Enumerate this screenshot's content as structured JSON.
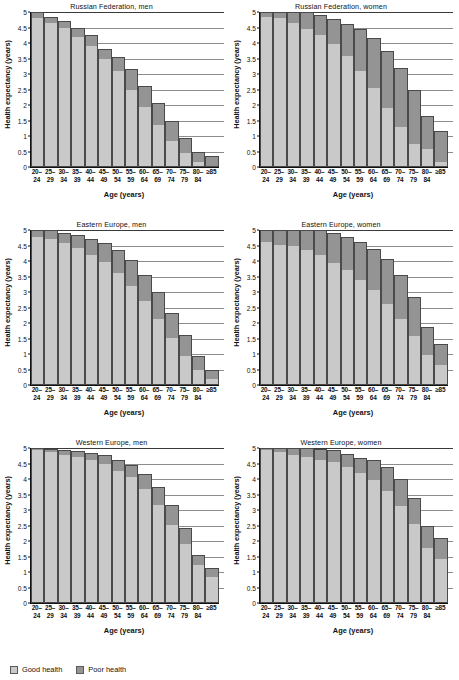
{
  "figure": {
    "axis_x_label": "Age (years)",
    "axis_y_label": "Health expectancy (years)",
    "y_ticks": [
      "5",
      "4.5",
      "4",
      "3.5",
      "3",
      "2.5",
      "2",
      "1.5",
      "1",
      "0.5",
      "0"
    ],
    "x_categories_line1": [
      "20–",
      "25–",
      "30–",
      "35–",
      "40–",
      "45–",
      "50–",
      "55–",
      "60–",
      "65–",
      "70–",
      "75–",
      "80–",
      "≥85"
    ],
    "x_categories_line2": [
      "24",
      "29",
      "34",
      "39",
      "44",
      "49",
      "54",
      "59",
      "64",
      "69",
      "74",
      "79",
      "84",
      ""
    ],
    "colors": {
      "good_health": "#c9c9c9",
      "poor_health": "#949494",
      "outline": "#4a4a4a",
      "gridline": "#8c8c8c"
    }
  },
  "legend": {
    "items": [
      {
        "label": "Good health",
        "color": "#c9c9c9"
      },
      {
        "label": "Poor health",
        "color": "#949494"
      }
    ]
  },
  "chart_data": [
    {
      "type": "bar",
      "title": "Russian Federation, men",
      "xlabel": "Age (years)",
      "ylabel": "Health expectancy (years)",
      "ylim": [
        0,
        5
      ],
      "grid": true,
      "stacked": true,
      "categories": [
        "20–24",
        "25–29",
        "30–34",
        "35–39",
        "40–44",
        "45–49",
        "50–54",
        "55–59",
        "60–64",
        "65–69",
        "70–74",
        "75–79",
        "80–84",
        "≥85"
      ],
      "series": [
        {
          "name": "Good health",
          "values": [
            4.8,
            4.65,
            4.5,
            4.2,
            3.9,
            3.5,
            3.1,
            2.5,
            1.95,
            1.35,
            0.85,
            0.45,
            0.15,
            0.0
          ]
        },
        {
          "name": "Poor health",
          "values": [
            0.2,
            0.2,
            0.2,
            0.3,
            0.35,
            0.3,
            0.45,
            0.65,
            0.65,
            0.7,
            0.62,
            0.5,
            0.35,
            0.32
          ]
        }
      ],
      "totals": [
        5.0,
        4.85,
        4.7,
        4.5,
        4.25,
        3.8,
        3.55,
        3.15,
        2.6,
        2.05,
        1.47,
        0.95,
        0.5,
        0.32
      ]
    },
    {
      "type": "bar",
      "title": "Russian Federation, women",
      "xlabel": "Age (years)",
      "ylabel": "Health expectancy (years)",
      "ylim": [
        0,
        5
      ],
      "grid": true,
      "stacked": true,
      "categories": [
        "20–24",
        "25–29",
        "30–34",
        "35–39",
        "40–44",
        "45–49",
        "50–54",
        "55–59",
        "60–64",
        "65–69",
        "70–74",
        "75–79",
        "80–84",
        "≥85"
      ],
      "series": [
        {
          "name": "Good health",
          "values": [
            4.85,
            4.8,
            4.65,
            4.45,
            4.27,
            3.97,
            3.58,
            3.1,
            2.55,
            1.9,
            1.28,
            0.75,
            0.58,
            0.17
          ]
        },
        {
          "name": "Poor health",
          "values": [
            0.15,
            0.2,
            0.35,
            0.55,
            0.63,
            0.82,
            1.02,
            1.35,
            1.6,
            1.85,
            1.92,
            1.73,
            1.05,
            0.98
          ]
        }
      ],
      "totals": [
        5.0,
        5.0,
        5.0,
        5.0,
        4.9,
        4.79,
        4.6,
        4.45,
        4.15,
        3.75,
        3.2,
        2.48,
        1.63,
        1.15
      ]
    },
    {
      "type": "bar",
      "title": "Eastern Europe, men",
      "xlabel": "Age (years)",
      "ylabel": "Health expectancy (years)",
      "ylim": [
        0,
        5
      ],
      "grid": true,
      "stacked": true,
      "categories": [
        "20–24",
        "25–29",
        "30–34",
        "35–39",
        "40–44",
        "45–49",
        "50–54",
        "55–59",
        "60–64",
        "65–69",
        "70–74",
        "75–79",
        "80–84",
        "≥85"
      ],
      "series": [
        {
          "name": "Good health",
          "values": [
            4.78,
            4.7,
            4.57,
            4.43,
            4.2,
            3.98,
            3.62,
            3.2,
            2.7,
            2.12,
            1.52,
            0.93,
            0.47,
            0.18
          ]
        },
        {
          "name": "Poor health",
          "values": [
            0.22,
            0.3,
            0.33,
            0.4,
            0.52,
            0.6,
            0.72,
            0.83,
            0.85,
            0.87,
            0.8,
            0.69,
            0.47,
            0.3
          ]
        }
      ],
      "totals": [
        5.0,
        5.0,
        4.9,
        4.83,
        4.72,
        4.58,
        4.34,
        4.03,
        3.55,
        2.99,
        2.32,
        1.62,
        0.94,
        0.48
      ]
    },
    {
      "type": "bar",
      "title": "Eastern Europe, women",
      "xlabel": "Age (years)",
      "ylabel": "Health expectancy (years)",
      "ylim": [
        0,
        5
      ],
      "grid": true,
      "stacked": true,
      "categories": [
        "20–24",
        "25–29",
        "30–34",
        "35–39",
        "40–44",
        "45–49",
        "50–54",
        "55–59",
        "60–64",
        "65–69",
        "70–74",
        "75–79",
        "80–84",
        "≥85"
      ],
      "series": [
        {
          "name": "Good health",
          "values": [
            4.6,
            4.52,
            4.48,
            4.35,
            4.18,
            3.95,
            3.7,
            3.4,
            3.05,
            2.62,
            2.12,
            1.58,
            0.98,
            0.65
          ]
        },
        {
          "name": "Poor health",
          "values": [
            0.4,
            0.48,
            0.52,
            0.65,
            0.82,
            0.95,
            1.08,
            1.2,
            1.35,
            1.45,
            1.43,
            1.27,
            0.9,
            0.68
          ]
        }
      ],
      "totals": [
        5.0,
        5.0,
        5.0,
        5.0,
        5.0,
        4.9,
        4.78,
        4.6,
        4.4,
        4.07,
        3.55,
        2.85,
        1.88,
        1.33
      ]
    },
    {
      "type": "bar",
      "title": "Western Europe, men",
      "xlabel": "Age (years)",
      "ylabel": "Health expectancy (years)",
      "ylim": [
        0,
        5
      ],
      "grid": true,
      "stacked": true,
      "categories": [
        "20–24",
        "25–29",
        "30–34",
        "35–39",
        "40–44",
        "45–49",
        "50–54",
        "55–59",
        "60–64",
        "65–69",
        "70–74",
        "75–79",
        "80–84",
        "≥85"
      ],
      "series": [
        {
          "name": "Good health",
          "values": [
            4.93,
            4.87,
            4.78,
            4.72,
            4.62,
            4.5,
            4.27,
            4.05,
            3.67,
            3.17,
            2.53,
            1.9,
            1.22,
            0.85
          ]
        },
        {
          "name": "Poor health",
          "values": [
            0.07,
            0.1,
            0.17,
            0.2,
            0.23,
            0.28,
            0.35,
            0.4,
            0.48,
            0.57,
            0.62,
            0.52,
            0.33,
            0.28
          ]
        }
      ],
      "totals": [
        5.0,
        4.97,
        4.95,
        4.92,
        4.85,
        4.78,
        4.62,
        4.45,
        4.15,
        3.74,
        3.15,
        2.42,
        1.55,
        1.13
      ]
    },
    {
      "type": "bar",
      "title": "Western Europe, women",
      "xlabel": "Age (years)",
      "ylabel": "Health expectancy (years)",
      "ylim": [
        0,
        5
      ],
      "grid": true,
      "stacked": true,
      "categories": [
        "20–24",
        "25–29",
        "30–34",
        "35–39",
        "40–44",
        "45–49",
        "50–54",
        "55–59",
        "60–64",
        "65–69",
        "70–74",
        "75–79",
        "80–84",
        "≥85"
      ],
      "series": [
        {
          "name": "Good health",
          "values": [
            4.93,
            4.87,
            4.78,
            4.72,
            4.62,
            4.55,
            4.38,
            4.18,
            3.97,
            3.62,
            3.12,
            2.55,
            1.78,
            1.43
          ]
        },
        {
          "name": "Poor health",
          "values": [
            0.07,
            0.13,
            0.22,
            0.28,
            0.35,
            0.4,
            0.42,
            0.5,
            0.63,
            0.77,
            0.88,
            0.85,
            0.72,
            0.68
          ]
        }
      ],
      "totals": [
        5.0,
        5.0,
        5.0,
        5.0,
        4.97,
        4.95,
        4.8,
        4.68,
        4.6,
        4.39,
        4.0,
        3.4,
        2.5,
        2.11
      ]
    }
  ]
}
